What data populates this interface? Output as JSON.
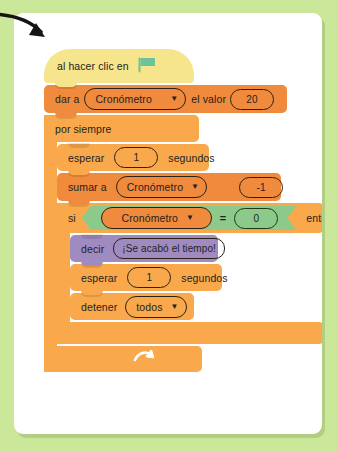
{
  "page": {
    "background_color": "#cbe79a",
    "card_color": "#ffffff"
  },
  "annotation": {
    "arrow_name": "pointer-arrow",
    "arrow_color": "#141414"
  },
  "palette": {
    "events_yellow": "#f6e58c",
    "data_orange": "#f08a3c",
    "control_orange": "#f9a94b",
    "looks_purple": "#a08bc0",
    "operator_green": "#8cc98a",
    "flag_green": "#6fc39a",
    "text_dark": "#231f20"
  },
  "script": {
    "hat": {
      "label": "al hacer clic en",
      "icon": "green-flag-icon"
    },
    "set_variable": {
      "prefix": "dar a",
      "variable": "Cronómetro",
      "middle": "el valor",
      "value": "20"
    },
    "forever": {
      "label": "por siempre"
    },
    "wait_1": {
      "prefix": "esperar",
      "value": "1",
      "suffix": "segundos"
    },
    "change_variable": {
      "prefix": "sumar a",
      "variable": "Cronómetro",
      "value": "-1"
    },
    "if_block": {
      "prefix": "si",
      "suffix": "entonces",
      "condition": {
        "left_variable": "Cronómetro",
        "operator": "=",
        "right_value": "0"
      }
    },
    "say": {
      "prefix": "decir",
      "message": "¡Se acabó el tiempo!"
    },
    "wait_2": {
      "prefix": "esperar",
      "value": "1",
      "suffix": "segundos"
    },
    "stop": {
      "prefix": "detener",
      "option": "todos"
    },
    "loop_arrow_icon": "loop-arrow-icon"
  }
}
